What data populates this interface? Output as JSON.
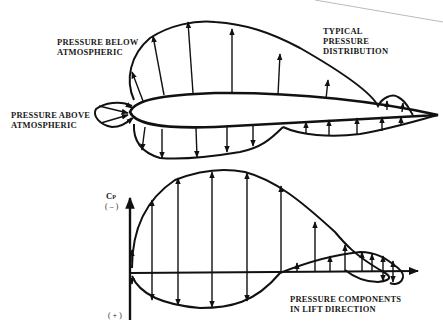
{
  "diagram": {
    "colors": {
      "ink": "#111111",
      "background": "#ffffff",
      "faint_line": "#bbbbbb"
    },
    "top_panel": {
      "labels": {
        "pressure_below": [
          "PRESSURE BELOW",
          "ATMOSPHERIC"
        ],
        "pressure_above": [
          "PRESSURE ABOVE",
          "ATMOSPHERIC"
        ],
        "typical": [
          "TYPICAL",
          "PRESSURE",
          "DISTRIBUTION"
        ]
      }
    },
    "bottom_panel": {
      "axis_label": "C",
      "axis_label_sub": "P",
      "axis_top": "( – )",
      "axis_bottom": "( + )",
      "caption": [
        "PRESSURE COMPONENTS",
        "IN LIFT DIRECTION"
      ]
    }
  }
}
